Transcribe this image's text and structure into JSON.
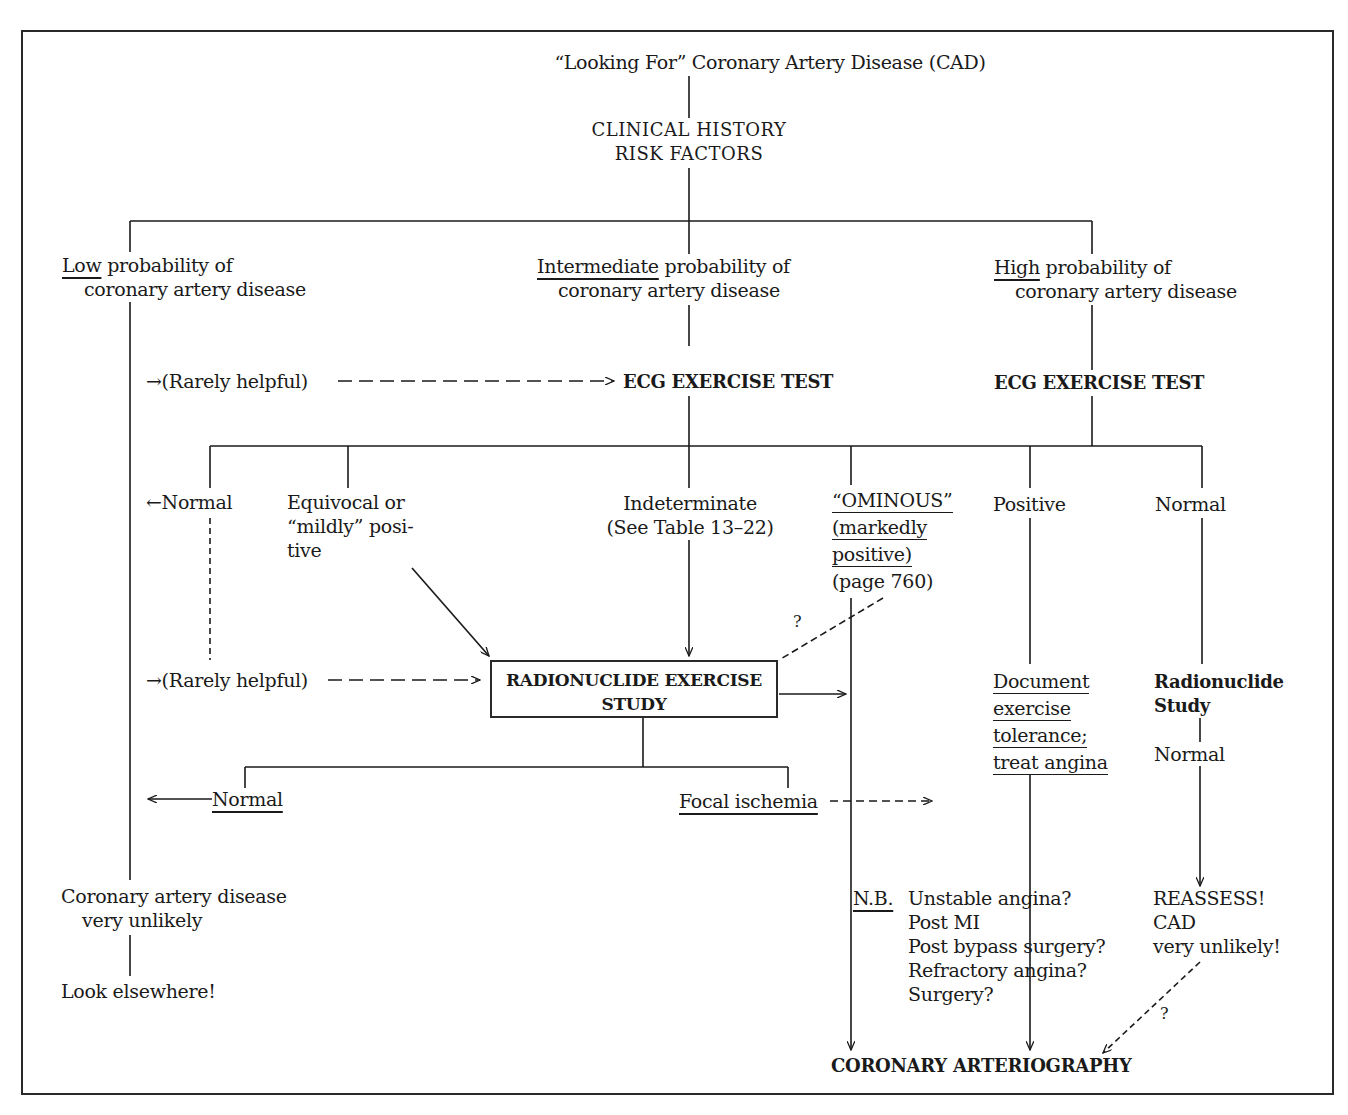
{
  "title": "“Looking For” Coronary Artery Disease (CAD)",
  "root": {
    "line1": "CLINICAL  HISTORY",
    "line2": "RISK  FACTORS"
  },
  "probability": {
    "low": {
      "emph": "Low",
      "rest": " probability of",
      "line2": "coronary artery disease"
    },
    "intermediate": {
      "emph": "Intermediate",
      "rest": " probability of",
      "line2": "coronary artery disease"
    },
    "high": {
      "emph": "High",
      "rest": " probability of",
      "line2": "coronary artery disease"
    }
  },
  "rarely_helpful_1": "→(Rarely helpful)",
  "ecg_test_intermediate": "ECG EXERCISE TEST",
  "ecg_test_high": "ECG EXERCISE TEST",
  "ecg_results": {
    "normal": "←Normal",
    "equivocal": [
      "Equivocal or",
      "“mildly” posi-",
      "tive"
    ],
    "indeterminate": [
      "Indeterminate",
      "(See Table 13–22)"
    ],
    "ominous": [
      "“OMINOUS”",
      "(markedly",
      "positive)",
      "(page 760)"
    ],
    "positive": "Positive",
    "normal_high": "Normal"
  },
  "rarely_helpful_2": "→(Rarely helpful)",
  "radionuclide_box": {
    "line1": "RADIONUCLIDE EXERCISE",
    "line2": "STUDY"
  },
  "question_mark": "?",
  "radionuclide_results": {
    "normal": "Normal",
    "focal": "Focal ischemia"
  },
  "document": [
    "Document",
    "exercise",
    "tolerance;",
    "treat angina"
  ],
  "radionuclide_study_high": {
    "line1": "Radionuclide",
    "line2": "Study",
    "result": "Normal"
  },
  "low_outcome": {
    "line1": "Coronary artery disease",
    "line2": "very unlikely",
    "action": "Look elsewhere!"
  },
  "nb": {
    "label": "N.B.",
    "items": [
      "Unstable angina?",
      "Post MI",
      "Post bypass surgery?",
      "Refractory angina?",
      "Surgery?"
    ]
  },
  "reassess": [
    "REASSESS!",
    "CAD",
    "very unlikely!"
  ],
  "final": "CORONARY ARTERIOGRAPHY"
}
